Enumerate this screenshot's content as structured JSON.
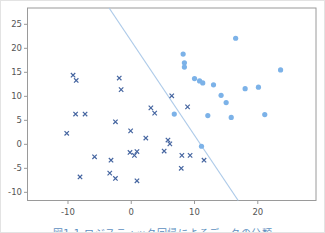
{
  "figure": {
    "caption": "図1.1 ロジスティック回帰によるデータの分類",
    "caption_color": "#5d8fc0"
  },
  "chart_data": {
    "type": "scatter",
    "title": "",
    "xlabel": "",
    "ylabel": "",
    "grid": false,
    "legend": "none",
    "xlim": [
      -16.4,
      29.2
    ],
    "ylim": [
      -11.7,
      28.4
    ],
    "xticks": [
      -10,
      0,
      10,
      20
    ],
    "ytick_labels": [
      "-10",
      "-5",
      "0",
      "5",
      "10",
      "15",
      "20",
      "25"
    ],
    "yticks": [
      -10,
      -5,
      0,
      5,
      10,
      15,
      20,
      25
    ],
    "axis_color": "#9a9a9a",
    "tick_label_color": "#555555",
    "series": [
      {
        "name": "class-x",
        "marker": "x",
        "color": "#4565a0",
        "points": [
          [
            -9.2,
            14.4
          ],
          [
            -8.7,
            13.3
          ],
          [
            -1.9,
            13.8
          ],
          [
            -1.6,
            11.4
          ],
          [
            -8.8,
            6.3
          ],
          [
            -7.3,
            6.3
          ],
          [
            -2.5,
            4.7
          ],
          [
            3.1,
            7.6
          ],
          [
            3.7,
            6.5
          ],
          [
            6.4,
            10.1
          ],
          [
            8.9,
            7.8
          ],
          [
            -10.2,
            2.3
          ],
          [
            -0.1,
            2.8
          ],
          [
            2.3,
            1.3
          ],
          [
            5.8,
            0.9
          ],
          [
            6.1,
            0.1
          ],
          [
            5.2,
            -1.4
          ],
          [
            -0.2,
            -1.7
          ],
          [
            0.5,
            -2.3
          ],
          [
            0.9,
            -1.5
          ],
          [
            -5.8,
            -2.6
          ],
          [
            -3.2,
            -3.3
          ],
          [
            8.0,
            -2.3
          ],
          [
            9.3,
            -2.3
          ],
          [
            11.5,
            -3.3
          ],
          [
            7.9,
            -5.0
          ],
          [
            -8.1,
            -6.8
          ],
          [
            -3.4,
            -6.0
          ],
          [
            -2.5,
            -7.1
          ],
          [
            0.9,
            -7.6
          ]
        ]
      },
      {
        "name": "class-o",
        "marker": "circle",
        "color": "#7cb2e8",
        "points": [
          [
            16.5,
            22.1
          ],
          [
            8.2,
            18.8
          ],
          [
            8.4,
            17.0
          ],
          [
            8.4,
            16.1
          ],
          [
            23.6,
            15.5
          ],
          [
            10.0,
            13.7
          ],
          [
            10.8,
            13.2
          ],
          [
            11.3,
            12.8
          ],
          [
            13.0,
            12.4
          ],
          [
            18.0,
            11.6
          ],
          [
            20.1,
            11.9
          ],
          [
            14.2,
            10.2
          ],
          [
            15.0,
            8.7
          ],
          [
            6.8,
            6.3
          ],
          [
            12.1,
            6.0
          ],
          [
            15.8,
            5.6
          ],
          [
            21.1,
            6.2
          ],
          [
            11.1,
            -0.4
          ]
        ]
      }
    ],
    "decision_boundary": {
      "color": "#aecbe9",
      "points": [
        [
          -3.5,
          28.4
        ],
        [
          16.9,
          -11.7
        ]
      ]
    }
  }
}
